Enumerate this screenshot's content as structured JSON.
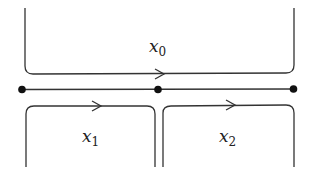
{
  "diagram": {
    "regions": [
      {
        "id": "top",
        "label": "x",
        "subscript": "0"
      },
      {
        "id": "bottom-left",
        "label": "x",
        "subscript": "1"
      },
      {
        "id": "bottom-right",
        "label": "x",
        "subscript": "2"
      }
    ],
    "nodes": 3,
    "colors": {
      "line": "#333333",
      "node": "#111111",
      "background": "#ffffff"
    }
  }
}
